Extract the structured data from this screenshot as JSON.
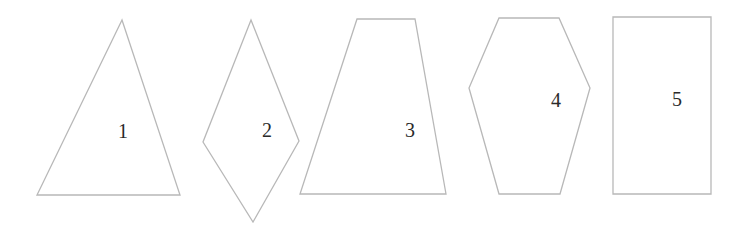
{
  "diagram": {
    "stroke_color": "#b8b8b8",
    "label_color": "#2a2a2a",
    "shapes": [
      {
        "id": 1,
        "type": "triangle",
        "label": "1",
        "points": "122,20 37,195 180,195",
        "label_pos": [
          123,
          138
        ]
      },
      {
        "id": 2,
        "type": "kite",
        "label": "2",
        "points": "251,20 299,141 253,222 203,142",
        "label_pos": [
          267,
          137
        ]
      },
      {
        "id": 3,
        "type": "trapezoid",
        "label": "3",
        "points": "357,19 415,19 446,194 300,194",
        "label_pos": [
          410,
          137
        ]
      },
      {
        "id": 4,
        "type": "hexagon",
        "label": "4",
        "points": "499,18 559,18 590,88 560,194 499,194 469,88",
        "label_pos": [
          556,
          107
        ]
      },
      {
        "id": 5,
        "type": "rectangle",
        "label": "5",
        "points": "613,17 711,17 711,194 613,194",
        "label_pos": [
          677,
          106
        ]
      }
    ]
  }
}
